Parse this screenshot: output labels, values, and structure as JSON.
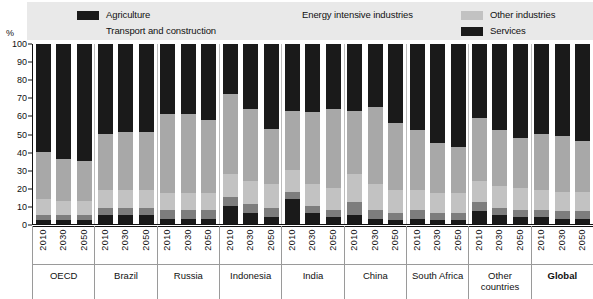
{
  "legend": {
    "items": [
      {
        "label": "Agriculture",
        "color": "#1a1a1a",
        "key": "agriculture",
        "row": 0,
        "pos": "li-agri"
      },
      {
        "label": "Energy intensive industries",
        "color": "#7d7d7d",
        "key": "energy_intensive",
        "row": 0,
        "pos": "li-energy"
      },
      {
        "label": "Other industries",
        "color": "#c2c2c2",
        "key": "other_industries",
        "row": 0,
        "pos": "li-other"
      },
      {
        "label": "Transport and construction",
        "color": "#a8a8a8",
        "key": "transport_construction",
        "row": 1,
        "pos": "li-transport"
      },
      {
        "label": "Services",
        "color": "#1a1a1a",
        "key": "services",
        "row": 1,
        "pos": "li-services"
      }
    ]
  },
  "axis": {
    "y_unit": "%",
    "y_ticks": [
      "100",
      "90",
      "80",
      "70",
      "60",
      "50",
      "40",
      "30",
      "20",
      "10",
      "0"
    ],
    "y_min": 0,
    "y_max": 100
  },
  "chart_data": {
    "type": "bar",
    "subtype": "stacked-bar-100",
    "title": "",
    "xlabel": "",
    "ylabel": "%",
    "ylim": [
      0,
      100
    ],
    "grid": false,
    "legend_position": "top",
    "stack_order_bottom_to_top": [
      "Agriculture",
      "Energy intensive industries",
      "Other industries",
      "Transport and construction",
      "Services"
    ],
    "series_colors": {
      "Agriculture": "#1a1a1a",
      "Energy intensive industries": "#7d7d7d",
      "Other industries": "#c2c2c2",
      "Transport and construction": "#a8a8a8",
      "Services": "#1a1a1a"
    },
    "categories": [
      "OECD",
      "Brazil",
      "Russia",
      "Indonesia",
      "India",
      "China",
      "South Africa",
      "Other countries",
      "Global"
    ],
    "years": [
      "2010",
      "2030",
      "2050"
    ],
    "groups": [
      {
        "name": "OECD",
        "bold": false,
        "bars": [
          {
            "year": "2010",
            "values": {
              "Agriculture": 2,
              "Energy intensive industries": 3,
              "Other industries": 9,
              "Transport and construction": 26,
              "Services": 60
            }
          },
          {
            "year": "2030",
            "values": {
              "Agriculture": 2,
              "Energy intensive industries": 3,
              "Other industries": 8,
              "Transport and construction": 23,
              "Services": 64
            }
          },
          {
            "year": "2050",
            "values": {
              "Agriculture": 2,
              "Energy intensive industries": 3,
              "Other industries": 8,
              "Transport and construction": 22,
              "Services": 65
            }
          }
        ]
      },
      {
        "name": "Brazil",
        "bold": false,
        "bars": [
          {
            "year": "2010",
            "values": {
              "Agriculture": 5,
              "Energy intensive industries": 4,
              "Other industries": 10,
              "Transport and construction": 31,
              "Services": 50
            }
          },
          {
            "year": "2030",
            "values": {
              "Agriculture": 5,
              "Energy intensive industries": 4,
              "Other industries": 10,
              "Transport and construction": 32,
              "Services": 49
            }
          },
          {
            "year": "2050",
            "values": {
              "Agriculture": 5,
              "Energy intensive industries": 4,
              "Other industries": 10,
              "Transport and construction": 32,
              "Services": 49
            }
          }
        ]
      },
      {
        "name": "Russia",
        "bold": false,
        "bars": [
          {
            "year": "2010",
            "values": {
              "Agriculture": 3,
              "Energy intensive industries": 5,
              "Other industries": 9,
              "Transport and construction": 44,
              "Services": 39
            }
          },
          {
            "year": "2030",
            "values": {
              "Agriculture": 3,
              "Energy intensive industries": 5,
              "Other industries": 9,
              "Transport and construction": 44,
              "Services": 39
            }
          },
          {
            "year": "2050",
            "values": {
              "Agriculture": 3,
              "Energy intensive industries": 5,
              "Other industries": 9,
              "Transport and construction": 41,
              "Services": 42
            }
          }
        ]
      },
      {
        "name": "Indonesia",
        "bold": false,
        "bars": [
          {
            "year": "2010",
            "values": {
              "Agriculture": 10,
              "Energy intensive industries": 5,
              "Other industries": 13,
              "Transport and construction": 44,
              "Services": 28
            }
          },
          {
            "year": "2030",
            "values": {
              "Agriculture": 6,
              "Energy intensive industries": 5,
              "Other industries": 13,
              "Transport and construction": 40,
              "Services": 36
            }
          },
          {
            "year": "2050",
            "values": {
              "Agriculture": 4,
              "Energy intensive industries": 5,
              "Other industries": 13,
              "Transport and construction": 31,
              "Services": 47
            }
          }
        ]
      },
      {
        "name": "India",
        "bold": false,
        "bars": [
          {
            "year": "2010",
            "values": {
              "Agriculture": 14,
              "Energy intensive industries": 4,
              "Other industries": 12,
              "Transport and construction": 33,
              "Services": 37
            }
          },
          {
            "year": "2030",
            "values": {
              "Agriculture": 6,
              "Energy intensive industries": 4,
              "Other industries": 12,
              "Transport and construction": 40,
              "Services": 38
            }
          },
          {
            "year": "2050",
            "values": {
              "Agriculture": 4,
              "Energy intensive industries": 4,
              "Other industries": 12,
              "Transport and construction": 44,
              "Services": 36
            }
          }
        ]
      },
      {
        "name": "China",
        "bold": false,
        "bars": [
          {
            "year": "2010",
            "values": {
              "Agriculture": 5,
              "Energy intensive industries": 7,
              "Other industries": 16,
              "Transport and construction": 35,
              "Services": 37
            }
          },
          {
            "year": "2030",
            "values": {
              "Agriculture": 3,
              "Energy intensive industries": 5,
              "Other industries": 14,
              "Transport and construction": 43,
              "Services": 35
            }
          },
          {
            "year": "2050",
            "values": {
              "Agriculture": 2,
              "Energy intensive industries": 4,
              "Other industries": 13,
              "Transport and construction": 37,
              "Services": 44
            }
          }
        ]
      },
      {
        "name": "South Africa",
        "bold": false,
        "bars": [
          {
            "year": "2010",
            "values": {
              "Agriculture": 3,
              "Energy intensive industries": 5,
              "Other industries": 11,
              "Transport and construction": 33,
              "Services": 48
            }
          },
          {
            "year": "2030",
            "values": {
              "Agriculture": 2,
              "Energy intensive industries": 4,
              "Other industries": 11,
              "Transport and construction": 28,
              "Services": 55
            }
          },
          {
            "year": "2050",
            "values": {
              "Agriculture": 2,
              "Energy intensive industries": 4,
              "Other industries": 11,
              "Transport and construction": 26,
              "Services": 57
            }
          }
        ]
      },
      {
        "name": "Other countries",
        "bold": false,
        "bars": [
          {
            "year": "2010",
            "values": {
              "Agriculture": 7,
              "Energy intensive industries": 5,
              "Other industries": 12,
              "Transport and construction": 35,
              "Services": 41
            }
          },
          {
            "year": "2030",
            "values": {
              "Agriculture": 5,
              "Energy intensive industries": 4,
              "Other industries": 12,
              "Transport and construction": 31,
              "Services": 48
            }
          },
          {
            "year": "2050",
            "values": {
              "Agriculture": 4,
              "Energy intensive industries": 4,
              "Other industries": 12,
              "Transport and construction": 28,
              "Services": 52
            }
          }
        ]
      },
      {
        "name": "Global",
        "bold": true,
        "bars": [
          {
            "year": "2010",
            "values": {
              "Agriculture": 4,
              "Energy intensive industries": 4,
              "Other industries": 11,
              "Transport and construction": 31,
              "Services": 50
            }
          },
          {
            "year": "2030",
            "values": {
              "Agriculture": 3,
              "Energy intensive industries": 4,
              "Other industries": 11,
              "Transport and construction": 31,
              "Services": 51
            }
          },
          {
            "year": "2050",
            "values": {
              "Agriculture": 3,
              "Energy intensive industries": 4,
              "Other industries": 11,
              "Transport and construction": 28,
              "Services": 54
            }
          }
        ]
      }
    ]
  }
}
